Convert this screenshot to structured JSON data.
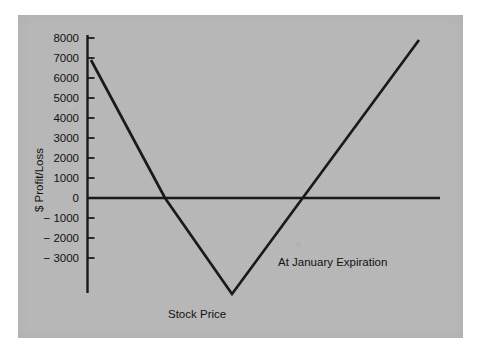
{
  "figure": {
    "background_color": "#ffffff",
    "plate_color": "#b9b9b9",
    "line_color": "#1a1a1a"
  },
  "chart_data": {
    "type": "line",
    "title": "",
    "subtitle": "",
    "xlabel": "Stock Price",
    "ylabel": "$ Profit/Loss",
    "annotations": [
      {
        "text": "At January Expiration",
        "x_px": 278,
        "y_px": 256
      }
    ],
    "grid": false,
    "legend": false,
    "legend_position": "none",
    "y_ticks": [
      8000,
      7000,
      6000,
      5000,
      4000,
      3000,
      2000,
      1000,
      0,
      -1000,
      -2000,
      -3000
    ],
    "y_tick_labels": [
      "8000",
      "7000",
      "6000",
      "5000",
      "4000",
      "3000",
      "2000",
      "1000",
      "0",
      "− 1000",
      "− 2000",
      "− 3000"
    ],
    "ylim": [
      -4900,
      8400
    ],
    "x_ticks": [],
    "x_tick_labels": [],
    "xlim": [
      0,
      100
    ],
    "zero_line": {
      "y": 0,
      "x_start": 0,
      "x_end": 100
    },
    "series": [
      {
        "name": "Long straddle payoff at expiration",
        "x": [
          1.1,
          22.1,
          41.1,
          94.0
        ],
        "y": [
          6900,
          0,
          -4800,
          7900
        ],
        "x_px": [
          91,
          165,
          232,
          419
        ],
        "y_px": [
          60,
          198,
          294,
          40
        ]
      }
    ],
    "vertex": {
      "x_px": 232,
      "y_px": 294,
      "value": -4800
    },
    "zero_crossings_px": [
      165,
      305
    ]
  },
  "axes": {
    "y_axis_line": {
      "x_px": 87,
      "y_top_px": 35,
      "y_bottom_px": 293
    },
    "zero_line": {
      "y_px": 198,
      "x_start_px": 87,
      "x_end_px": 440
    },
    "pixels_per_1000": 20
  },
  "labels": {
    "y_axis_title": "$ Profit/Loss",
    "x_axis_title": "Stock Price",
    "expiration_note": "At January Expiration"
  }
}
